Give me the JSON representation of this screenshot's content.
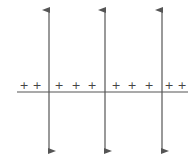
{
  "diagram": {
    "colors": {
      "line": "#555555",
      "charge": "#444444",
      "background": "#ffffff"
    },
    "horizontal_line": {
      "x1": 17,
      "x2": 188,
      "y": 92
    },
    "vertical_arrows": [
      {
        "id": "arrow-1",
        "x": 49,
        "y_top": 9,
        "y_bottom": 152
      },
      {
        "id": "arrow-2",
        "x": 105,
        "y_top": 9,
        "y_bottom": 152
      },
      {
        "id": "arrow-3",
        "x": 162,
        "y_top": 9,
        "y_bottom": 152
      }
    ],
    "charges": {
      "symbol": "+",
      "y": 89,
      "positions": [
        24,
        37,
        59,
        76,
        92,
        116,
        132,
        149,
        169,
        182
      ],
      "labels": [
        "+",
        "+",
        "+",
        "+",
        "+",
        "+",
        "+",
        "+",
        "+",
        "+"
      ]
    }
  }
}
